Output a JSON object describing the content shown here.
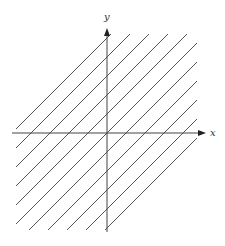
{
  "diagram": {
    "x_label": "x",
    "y_label": "y",
    "line_color": "#555555",
    "axis_color": "#444444",
    "offsets": [
      -95,
      -76,
      -57,
      -38,
      -19,
      0,
      19,
      38,
      57,
      76,
      95
    ],
    "box": {
      "left": 16,
      "right": 197,
      "top": 34,
      "bottom": 230
    },
    "origin": {
      "x": 107,
      "y": 133
    }
  }
}
